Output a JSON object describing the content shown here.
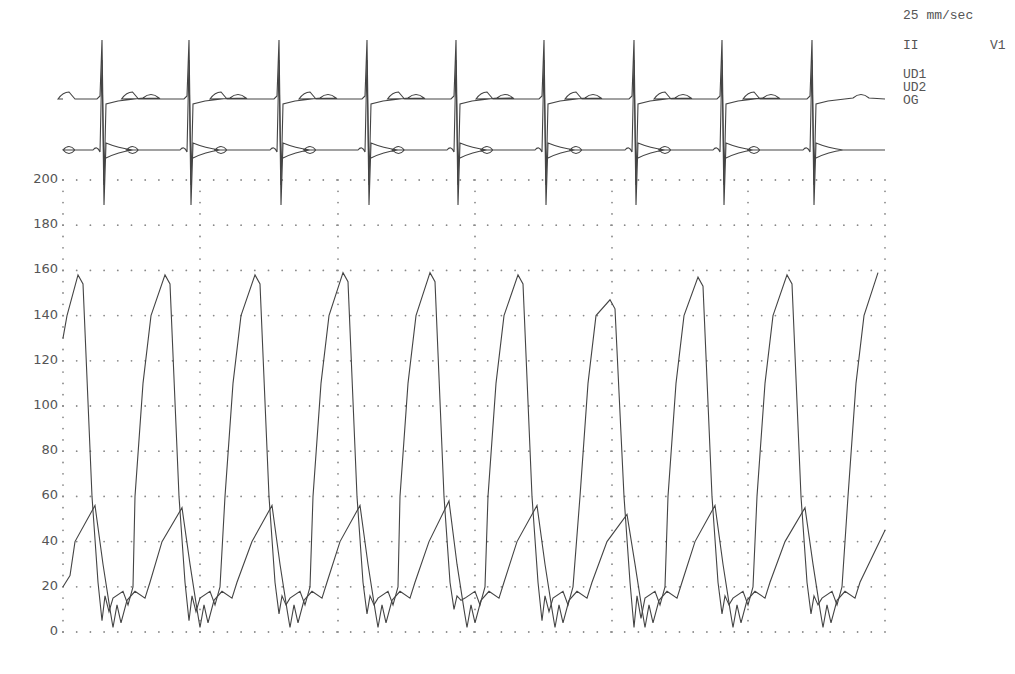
{
  "chart_data": {
    "type": "line",
    "title": "",
    "xlabel": "",
    "ylabel": "",
    "ylim": [
      0,
      200
    ],
    "y_ticks": [
      "200",
      "180",
      "160",
      "140",
      "120",
      "100",
      "80",
      "60",
      "40",
      "20",
      "0"
    ],
    "grid": true,
    "grid_style": "dotted",
    "paper_speed": "25 mm/sec",
    "ecg_leads": [
      "II",
      "V1"
    ],
    "legend": [
      "UD1",
      "UD2",
      "OG"
    ],
    "beats": 9,
    "beat_x": [
      103,
      190,
      280,
      368,
      457,
      545,
      635,
      723,
      813
    ],
    "series": [
      {
        "name": "UD1 (upper pressure waveform)",
        "peaks": [
          158,
          158,
          158,
          159,
          159,
          158,
          147,
          157,
          158,
          159
        ],
        "troughs": [
          5,
          5,
          8,
          8,
          10,
          5,
          2,
          8,
          8
        ]
      },
      {
        "name": "UD2 (lower pressure waveform)",
        "peaks": [
          56,
          55,
          56,
          56,
          58,
          56,
          52,
          56,
          55
        ],
        "min": 2
      }
    ]
  },
  "labels": {
    "speed": "25 mm/sec",
    "lead1": "II",
    "lead2": "V1",
    "leg1": "UD1",
    "leg2": "UD2",
    "leg3": "OG"
  },
  "colors": {
    "trace": "#444444",
    "grid": "#888888",
    "text": "#555555"
  }
}
